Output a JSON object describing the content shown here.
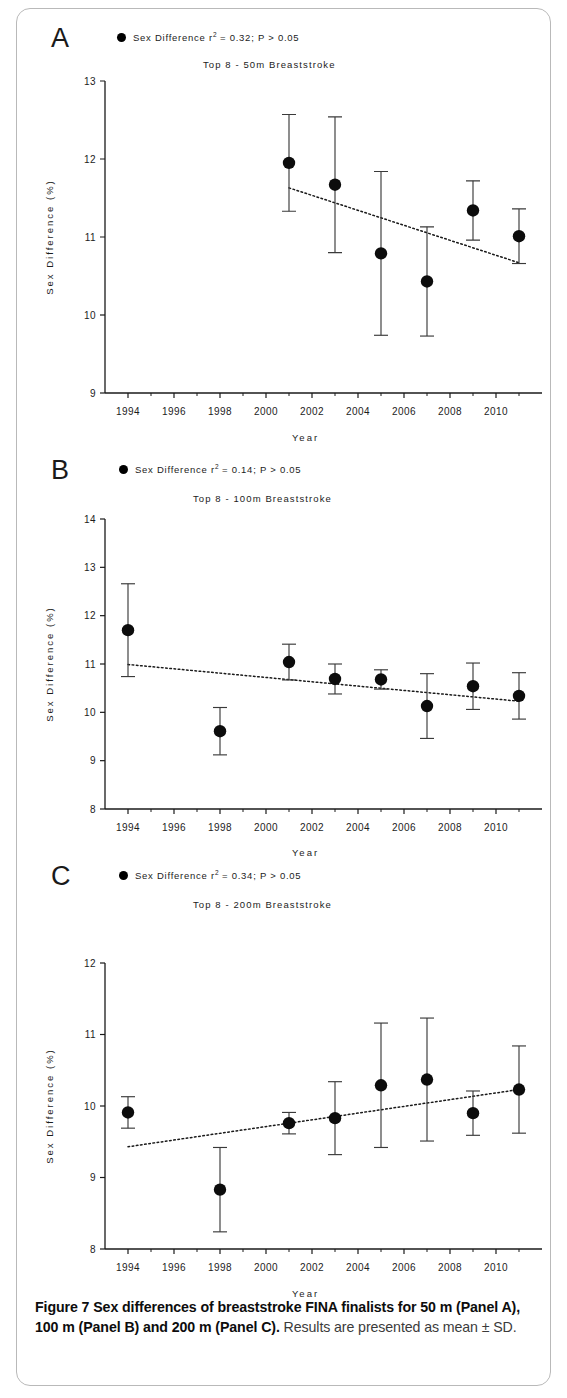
{
  "caption": {
    "bold": "Figure 7 Sex differences of breaststroke FINA finalists for 50 m (Panel A), 100 m (Panel B) and 200 m (Panel C).",
    "rest": " Results are presented as mean ± SD."
  },
  "panels": [
    {
      "letter": "A",
      "legend_label": "Sex Difference r",
      "legend_sup": "2",
      "legend_stats": "= 0.32; P > 0.05",
      "title": "Top 8 - 50m Breaststroke"
    },
    {
      "letter": "B",
      "legend_label": "Sex Difference r",
      "legend_sup": "2",
      "legend_stats": "= 0.14; P > 0.05",
      "title": "Top 8 - 100m Breaststroke"
    },
    {
      "letter": "C",
      "legend_label": "Sex Difference r",
      "legend_sup": "2",
      "legend_stats": "= 0.34; P > 0.05",
      "title": "Top 8 - 200m Breaststroke"
    }
  ],
  "chart_data": [
    {
      "type": "scatter",
      "panel": "A",
      "title": "Top 8 - 50m Breaststroke",
      "annotation": "Sex Difference r2 = 0.32; P > 0.05",
      "r_squared": 0.32,
      "p_text": "P > 0.05",
      "xlabel": "Year",
      "ylabel": "Sex Difference (%)",
      "xlim": [
        1993,
        2012
      ],
      "ylim": [
        9,
        13
      ],
      "yticks": [
        9,
        10,
        11,
        12,
        13
      ],
      "xticks": [
        1994,
        1996,
        1998,
        2000,
        2002,
        2004,
        2006,
        2008,
        2010
      ],
      "grid": false,
      "legend_position": "top",
      "x": [
        2001,
        2003,
        2005,
        2007,
        2009,
        2011
      ],
      "values": [
        11.95,
        11.67,
        10.79,
        10.43,
        11.34,
        11.01
      ],
      "err": [
        0.62,
        0.87,
        1.05,
        0.7,
        0.38,
        0.35
      ],
      "trendline": {
        "x": [
          2001,
          2011
        ],
        "y": [
          11.63,
          10.67
        ]
      },
      "marker": "filled-circle",
      "error_type": "SD"
    },
    {
      "type": "scatter",
      "panel": "B",
      "title": "Top 8 - 100m Breaststroke",
      "annotation": "Sex Difference r2 = 0.14; P > 0.05",
      "r_squared": 0.14,
      "p_text": "P > 0.05",
      "xlabel": "Year",
      "ylabel": "Sex Difference (%)",
      "xlim": [
        1993,
        2012
      ],
      "ylim": [
        8,
        14
      ],
      "yticks": [
        8,
        9,
        10,
        11,
        12,
        13,
        14
      ],
      "xticks": [
        1994,
        1996,
        1998,
        2000,
        2002,
        2004,
        2006,
        2008,
        2010
      ],
      "grid": false,
      "legend_position": "top",
      "x": [
        1994,
        1998,
        2001,
        2003,
        2005,
        2007,
        2009,
        2011
      ],
      "values": [
        11.7,
        9.61,
        11.04,
        10.69,
        10.68,
        10.13,
        10.54,
        10.34
      ],
      "err": [
        0.96,
        0.49,
        0.37,
        0.31,
        0.2,
        0.67,
        0.48,
        0.48
      ],
      "trendline": {
        "x": [
          1994,
          2011
        ],
        "y": [
          10.99,
          10.23
        ]
      },
      "marker": "filled-circle",
      "error_type": "SD"
    },
    {
      "type": "scatter",
      "panel": "C",
      "title": "Top 8 - 200m Breaststroke",
      "annotation": "Sex Difference r2 = 0.34; P > 0.05",
      "r_squared": 0.34,
      "p_text": "P > 0.05",
      "xlabel": "Year",
      "ylabel": "Sex Difference (%)",
      "xlim": [
        1993,
        2012
      ],
      "ylim": [
        8,
        12
      ],
      "yticks": [
        8,
        9,
        10,
        11,
        12
      ],
      "xticks": [
        1994,
        1996,
        1998,
        2000,
        2002,
        2004,
        2006,
        2008,
        2010
      ],
      "grid": false,
      "legend_position": "top",
      "x": [
        1994,
        1998,
        2001,
        2003,
        2005,
        2007,
        2009,
        2011
      ],
      "values": [
        9.91,
        8.83,
        9.76,
        9.83,
        10.29,
        10.37,
        9.9,
        10.23
      ],
      "err": [
        0.22,
        0.59,
        0.15,
        0.51,
        0.87,
        0.86,
        0.31,
        0.61
      ],
      "trendline": {
        "x": [
          1994,
          2011
        ],
        "y": [
          9.43,
          10.23
        ]
      },
      "marker": "filled-circle",
      "error_type": "SD"
    }
  ]
}
